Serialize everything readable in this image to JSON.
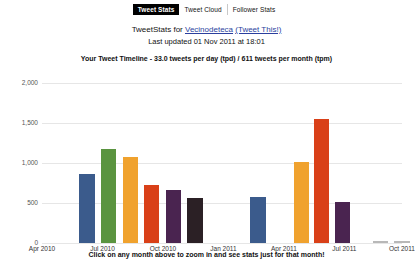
{
  "tabs": [
    {
      "label": "Tweet Stats",
      "active": true
    },
    {
      "label": "Tweet Cloud",
      "active": false
    },
    {
      "label": "Follower Stats",
      "active": false
    }
  ],
  "header": {
    "prefix": "TweetStats for ",
    "username": "Vecinodeteca",
    "tweet_this": "(Tweet This!)",
    "last_updated": "Last updated 01 Nov 2011 at 18:01"
  },
  "subtitle": "Your Tweet Timeline - 33.0 tweets per day (tpd) / 611 tweets per month (tpm)",
  "footer": "Click on any month above to zoom in and see stats just for that month!",
  "chart_data": {
    "type": "bar",
    "title": "Your Tweet Timeline - 33.0 tweets per day (tpd) / 611 tweets per month (tpm)",
    "xlabel": "",
    "ylabel": "",
    "ylim": [
      0,
      2000
    ],
    "yticks": [
      0,
      500,
      1000,
      1500,
      2000
    ],
    "ytick_labels": [
      "0",
      "500",
      "1,000",
      "1,500",
      "2,000"
    ],
    "grid": true,
    "legend": false,
    "xtick_labels": [
      "Apr 2010",
      "Jul 2010",
      "Oct 2010",
      "Jan 2011",
      "Apr 2011",
      "Jul 2011",
      "Oct 2011"
    ],
    "xtick_positions": [
      0.0,
      0.168,
      0.336,
      0.504,
      0.672,
      0.84,
      1.0
    ],
    "categories": [
      "Jul 2010",
      "Aug 2010",
      "Sep 2010",
      "Oct 2010",
      "Nov 2010",
      "Dec 2010",
      "Apr 2011",
      "Jun 2011",
      "Jul 2011",
      "Aug 2011",
      "Oct 2011",
      "Nov 2011"
    ],
    "values": [
      860,
      1170,
      1075,
      725,
      660,
      565,
      580,
      1015,
      1545,
      510,
      30,
      30
    ],
    "colors": [
      "#3b5b8c",
      "#5a9440",
      "#f0a22e",
      "#d94018",
      "#4a2450",
      "#2b2025",
      "#3b5b8c",
      "#f0a22e",
      "#d94018",
      "#4a2450",
      "#b8b8b8",
      "#b8b8b8"
    ],
    "bar_positions": [
      0.125,
      0.185,
      0.245,
      0.305,
      0.365,
      0.425,
      0.6,
      0.72,
      0.777,
      0.835,
      0.94,
      1.0
    ],
    "bar_width_frac": 0.042
  }
}
